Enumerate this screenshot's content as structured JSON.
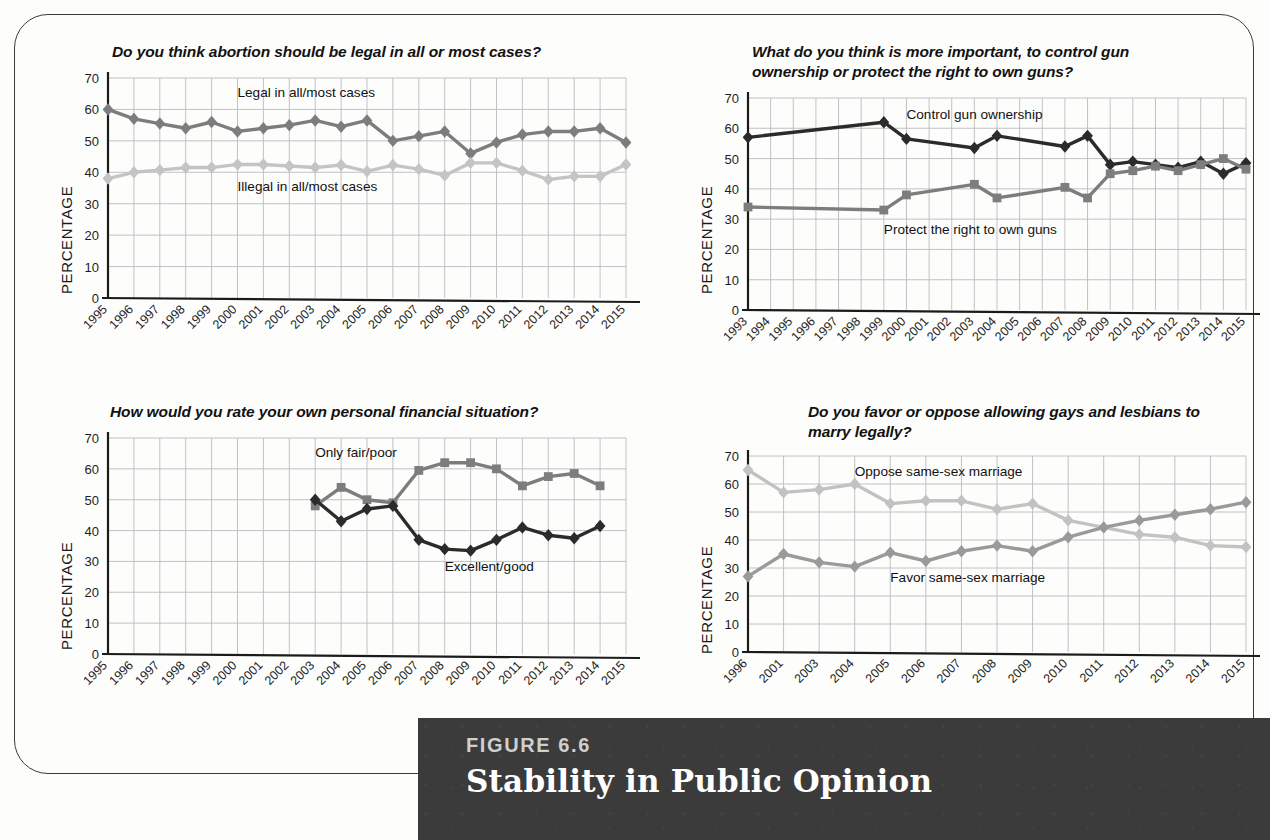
{
  "figure": {
    "number_label": "FIGURE 6.6",
    "title": "Stability in Public Opinion"
  },
  "axis": {
    "y_label": "PERCENTAGE",
    "y_ticks": [
      0,
      10,
      20,
      30,
      40,
      50,
      60,
      70
    ]
  },
  "colors": {
    "dark_series": "#2b2b2b",
    "mid_gray_series": "#7d7d7d",
    "light_gray_series": "#b9b9b9",
    "grid": "#b9bcc0",
    "axis": "#1b1b1b",
    "caption_bg": "#3b3b3b",
    "page_bg": "#fdfdfc"
  },
  "chart_data": [
    {
      "id": "abortion",
      "type": "line",
      "title": "Do you think abortion should be legal in all or most cases?",
      "xlabel": "",
      "ylabel": "PERCENTAGE",
      "ylim": [
        0,
        70
      ],
      "grid": true,
      "legend_position": "inline-annotations",
      "categories": [
        "1995",
        "1996",
        "1997",
        "1998",
        "1999",
        "2000",
        "2001",
        "2002",
        "2003",
        "2004",
        "2005",
        "2006",
        "2007",
        "2008",
        "2009",
        "2010",
        "2011",
        "2012",
        "2013",
        "2014",
        "2015"
      ],
      "series": [
        {
          "name": "Legal in all/most cases",
          "color": "#7d7d7d",
          "marker": "diamond",
          "values": [
            60,
            57,
            55.5,
            54,
            56,
            53,
            54,
            55,
            56.5,
            54.5,
            56.5,
            50,
            51.5,
            53,
            46,
            49.5,
            52,
            53,
            53,
            54,
            49.5
          ]
        },
        {
          "name": "Illegal in all/most cases",
          "color": "#c4c4c4",
          "marker": "diamond",
          "values": [
            38,
            40,
            40.7,
            41.5,
            41.5,
            42.5,
            42.5,
            42,
            41.5,
            42.3,
            40.3,
            42.3,
            41,
            39,
            43,
            43,
            40.5,
            37.7,
            38.7,
            38.7,
            42.5
          ]
        }
      ],
      "annotations": [
        {
          "text": "Legal in all/most cases",
          "x": "2000",
          "y": 64
        },
        {
          "text": "Illegal in all/most cases",
          "x": "2000",
          "y": 34
        }
      ]
    },
    {
      "id": "guns",
      "type": "line",
      "title": "What do you think is more important, to control gun ownership or protect the right to own guns?",
      "xlabel": "",
      "ylabel": "PERCENTAGE",
      "ylim": [
        0,
        70
      ],
      "grid": true,
      "legend_position": "inline-annotations",
      "categories": [
        "1993",
        "1994",
        "1995",
        "1996",
        "1997",
        "1998",
        "1999",
        "2000",
        "2001",
        "2002",
        "2003",
        "2004",
        "2005",
        "2006",
        "2007",
        "2008",
        "2009",
        "2010",
        "2011",
        "2012",
        "2013",
        "2014",
        "2015"
      ],
      "series": [
        {
          "name": "Control gun ownership",
          "color": "#2b2b2b",
          "marker": "diamond",
          "values": [
            57,
            null,
            null,
            null,
            null,
            null,
            62,
            56.5,
            null,
            null,
            53.5,
            57.5,
            null,
            null,
            54,
            57.5,
            48,
            49,
            48,
            47,
            49,
            45,
            48.5
          ]
        },
        {
          "name": "Protect the right to own guns",
          "color": "#7d7d7d",
          "marker": "square",
          "values": [
            34,
            null,
            null,
            null,
            null,
            null,
            33,
            38,
            null,
            null,
            41.5,
            37,
            null,
            null,
            40.5,
            37,
            45,
            46,
            47.5,
            46,
            48,
            50,
            46.5
          ]
        }
      ],
      "annotations": [
        {
          "text": "Control gun ownership",
          "x": "2000",
          "y": 63
        },
        {
          "text": "Protect the right to own guns",
          "x": "1999",
          "y": 25
        }
      ]
    },
    {
      "id": "finances",
      "type": "line",
      "title": "How would you rate your own personal financial situation?",
      "xlabel": "",
      "ylabel": "PERCENTAGE",
      "ylim": [
        0,
        70
      ],
      "grid": true,
      "legend_position": "inline-annotations",
      "categories": [
        "1995",
        "1996",
        "1997",
        "1998",
        "1999",
        "2000",
        "2001",
        "2002",
        "2003",
        "2004",
        "2005",
        "2006",
        "2007",
        "2008",
        "2009",
        "2010",
        "2011",
        "2012",
        "2013",
        "2014",
        "2015"
      ],
      "series": [
        {
          "name": "Only fair/poor",
          "color": "#7d7d7d",
          "marker": "square",
          "values": [
            null,
            null,
            null,
            null,
            null,
            null,
            null,
            null,
            48,
            54,
            50,
            49,
            59.5,
            62,
            62,
            60,
            54.5,
            57.5,
            58.5,
            54.5,
            null
          ]
        },
        {
          "name": "Excellent/good",
          "color": "#2b2b2b",
          "marker": "diamond",
          "values": [
            null,
            null,
            null,
            null,
            null,
            null,
            null,
            null,
            50,
            43,
            47,
            48,
            37,
            34,
            33.5,
            37,
            41,
            38.5,
            37.5,
            41.5,
            null
          ]
        }
      ],
      "annotations": [
        {
          "text": "Only fair/poor",
          "x": "2003",
          "y": 64
        },
        {
          "text": "Excellent/good",
          "x": "2008",
          "y": 27
        }
      ]
    },
    {
      "id": "marriage",
      "type": "line",
      "title": "Do you favor or oppose allowing gays and lesbians to marry legally?",
      "xlabel": "",
      "ylabel": "PERCENTAGE",
      "ylim": [
        0,
        70
      ],
      "grid": true,
      "legend_position": "inline-annotations",
      "categories": [
        "1996",
        "2001",
        "2003",
        "2004",
        "2005",
        "2006",
        "2007",
        "2008",
        "2009",
        "2010",
        "2011",
        "2012",
        "2013",
        "2014",
        "2015"
      ],
      "series": [
        {
          "name": "Oppose same-sex marriage",
          "color": "#c2c2c2",
          "marker": "diamond",
          "values": [
            65,
            57,
            58,
            60,
            53,
            54,
            54,
            51,
            53,
            47,
            44.5,
            42,
            41,
            38,
            37.5
          ]
        },
        {
          "name": "Favor same-sex marriage",
          "color": "#9a9a9a",
          "marker": "diamond",
          "values": [
            27,
            35,
            32,
            30.5,
            35.5,
            32.5,
            36,
            38,
            36,
            41,
            44.5,
            47,
            49,
            51,
            53.5
          ]
        }
      ],
      "annotations": [
        {
          "text": "Oppose same-sex marriage",
          "x": "2004",
          "y": 63
        },
        {
          "text": "Favor same-sex marriage",
          "x": "2005",
          "y": 25
        }
      ]
    }
  ]
}
